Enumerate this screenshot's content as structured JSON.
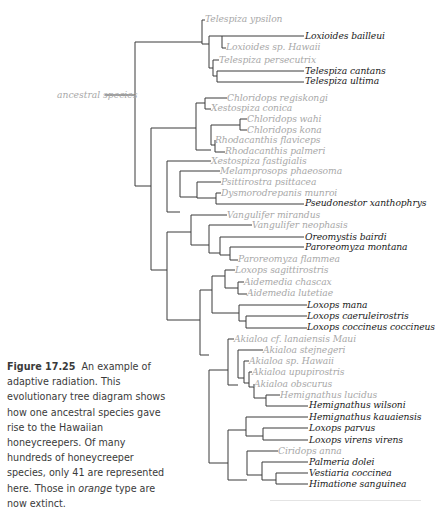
{
  "diagram": {
    "type": "phylogenetic-tree",
    "root_label": "ancestral species",
    "line_color": "#3a3a3a",
    "colors": {
      "extinct": "#a8a8a8",
      "extant": "#1a1a1a"
    },
    "leaves": [
      {
        "name": "Telespiza ypsilon",
        "x": 205,
        "y": 19,
        "extinct": true
      },
      {
        "name": "Loxioides bailleui",
        "x": 305,
        "y": 36,
        "extinct": false
      },
      {
        "name": "Loxioides sp. Hawaii",
        "x": 226,
        "y": 47,
        "extinct": true
      },
      {
        "name": "Telespiza persecutrix",
        "x": 219,
        "y": 60,
        "extinct": true
      },
      {
        "name": "Telespiza cantans",
        "x": 305,
        "y": 71,
        "extinct": false
      },
      {
        "name": "Telespiza ultima",
        "x": 305,
        "y": 81,
        "extinct": false
      },
      {
        "name": "Chloridops regiskongi",
        "x": 227,
        "y": 98,
        "extinct": true
      },
      {
        "name": "Xestospiza conica",
        "x": 211,
        "y": 108,
        "extinct": true
      },
      {
        "name": "Chloridops wahi",
        "x": 247,
        "y": 119,
        "extinct": true
      },
      {
        "name": "Chloridops kona",
        "x": 247,
        "y": 130,
        "extinct": true
      },
      {
        "name": "Rhodacanthis flaviceps",
        "x": 215,
        "y": 140,
        "extinct": true
      },
      {
        "name": "Rhodacanthis palmeri",
        "x": 225,
        "y": 151,
        "extinct": true
      },
      {
        "name": "Xestospiza fastigialis",
        "x": 211,
        "y": 161,
        "extinct": true
      },
      {
        "name": "Melamprosops phaeosoma",
        "x": 220,
        "y": 171,
        "extinct": true
      },
      {
        "name": "Psittirostra psittacea",
        "x": 221,
        "y": 182,
        "extinct": true
      },
      {
        "name": "Dysmorodrepanis munroi",
        "x": 221,
        "y": 193,
        "extinct": true
      },
      {
        "name": "Pseudonestor xanthophrys",
        "x": 305,
        "y": 203,
        "extinct": false
      },
      {
        "name": "Vangulifer mirandus",
        "x": 227,
        "y": 215,
        "extinct": true
      },
      {
        "name": "Vangulifer neophasis",
        "x": 252,
        "y": 225,
        "extinct": true
      },
      {
        "name": "Oreomystis bairdi",
        "x": 305,
        "y": 237,
        "extinct": false
      },
      {
        "name": "Paroreomyza montana",
        "x": 305,
        "y": 247,
        "extinct": false
      },
      {
        "name": "Paroreomyza flammea",
        "x": 238,
        "y": 259,
        "extinct": true
      },
      {
        "name": "Loxops sagittirostris",
        "x": 235,
        "y": 270,
        "extinct": true
      },
      {
        "name": "Aidemedia chascax",
        "x": 244,
        "y": 282,
        "extinct": true
      },
      {
        "name": "Aidemedia lutetiae",
        "x": 247,
        "y": 293,
        "extinct": true
      },
      {
        "name": "Loxops mana",
        "x": 307,
        "y": 305,
        "extinct": false
      },
      {
        "name": "Loxops caeruleirostris",
        "x": 307,
        "y": 316,
        "extinct": false
      },
      {
        "name": "Loxops coccineus coccineus",
        "x": 307,
        "y": 327,
        "extinct": false
      },
      {
        "name": "Akialoa cf. lanaiensis Maui",
        "x": 234,
        "y": 339,
        "extinct": true
      },
      {
        "name": "Akialoa stejnegeri",
        "x": 263,
        "y": 350,
        "extinct": true
      },
      {
        "name": "Akialoa sp. Hawaii",
        "x": 249,
        "y": 361,
        "extinct": true
      },
      {
        "name": "Akialoa upupirostris",
        "x": 252,
        "y": 372,
        "extinct": true
      },
      {
        "name": "Akialoa obscurus",
        "x": 254,
        "y": 384,
        "extinct": true
      },
      {
        "name": "Hemignathus lucidus",
        "x": 280,
        "y": 395,
        "extinct": true
      },
      {
        "name": "Hemignathus wilsoni",
        "x": 309,
        "y": 405,
        "extinct": false
      },
      {
        "name": "Hemignathus kauaiensis",
        "x": 309,
        "y": 417,
        "extinct": false
      },
      {
        "name": "Loxops parvus",
        "x": 309,
        "y": 428,
        "extinct": false
      },
      {
        "name": "Loxops virens virens",
        "x": 309,
        "y": 440,
        "extinct": false
      },
      {
        "name": "Ciridops anna",
        "x": 278,
        "y": 451,
        "extinct": true
      },
      {
        "name": "Palmeria dolei",
        "x": 309,
        "y": 462,
        "extinct": false
      },
      {
        "name": "Vestiaria coccinea",
        "x": 309,
        "y": 473,
        "extinct": false
      },
      {
        "name": "Himatione sanguinea",
        "x": 309,
        "y": 484,
        "extinct": false
      }
    ],
    "branches": [
      "M105,95 H135",
      "M135,42 V186 M135,42 H202 M135,186 H151",
      "M202,20 V44 M202,20 H205 M202,44 H209",
      "M209,36 V68 M209,36 H304 M222,36 V48 H226 M209,68 H213",
      "M213,60 V76 M213,60 H219 M213,76 H217 M217,71 V82 M217,71 H304 M217,82 H304",
      "M151,128 V270 M151,128 H196 M151,270 H167",
      "M196,103 V150 M196,103 H205 M196,150 H211",
      "M205,98 V109 M205,98 H227 M205,109 H211",
      "M211,125 V145 M211,125 H240 M211,145 H215",
      "M240,119 V130 M240,119 H247 M240,130 H247",
      "M215,140 V152 M215,140 H215 M215,152 H225",
      "M167,161 V212 M167,161 H211 M167,212 H180",
      "M180,171 V197 M180,171 H220 M180,197 H197",
      "M197,182 V198 M197,182 H221 M197,198 H216 M216,193 V204 M216,193 H221 M216,204 H304",
      "M167,232 V320 M167,232 H191 M167,320 H200",
      "M191,215 V245 M191,215 H227 M191,245 H209",
      "M209,225 V253 M209,225 H252 M209,253 H220",
      "M220,237 V255 M220,237 H304 M220,255 H230 M230,247 V260 M230,247 H304 M230,260 H238",
      "M200,290 V355 M200,290 H212 M200,355 H209",
      "M212,276 V313 M212,276 H225 M212,313 H239",
      "M225,270 V288 M225,270 H235 M225,288 H238 M238,282 V294 M238,282 H244 M238,294 H247",
      "M239,305 V321 M239,305 H307 M239,321 H246 M246,316 V328 M246,316 H307 M246,328 H307",
      "M209,370 V463 M209,370 H228 M209,463 H228",
      "M228,339 V385 M228,339 H234 M228,385 H238",
      "M238,350 V378 M238,350 H263 M238,378 H244 M244,361 V383 M244,361 H249 M244,383 H249",
      "M249,372 V387 M249,372 H252 M249,387 H254 M254,384 V398 M254,384 H254 M254,398 H266",
      "M266,395 V406 M266,395 H280 M266,406 H308",
      "M228,430 V480 M228,430 H246 M228,480 H247",
      "M246,417 V436 M246,417 H308 M246,436 H263 M263,428 V440 M263,428 H308 M263,440 H308",
      "M247,451 V475 M247,451 H278 M247,475 H262 M262,462 V480 M262,462 H308 M262,480 H276",
      "M276,473 V484 M276,473 H308 M276,484 H308"
    ]
  },
  "caption": {
    "figure_label": "Figure 17.25",
    "text_before": "An example of adaptive radiation. This evolutionary tree diagram shows how one ancestral species gave rise to the Hawaiian honeycreepers. Of many hundreds of honeycreeper species, only 41 are represented here. Those in",
    "emphasis": "orange",
    "text_after": "type are now extinct."
  }
}
